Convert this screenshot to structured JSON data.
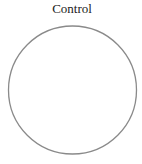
{
  "title": "Control",
  "circle": {
    "cx": 72.5,
    "cy": 90,
    "r": 64,
    "stroke": "#8a8a8a",
    "stroke_width": 1.3,
    "fill": "#ffffff"
  }
}
